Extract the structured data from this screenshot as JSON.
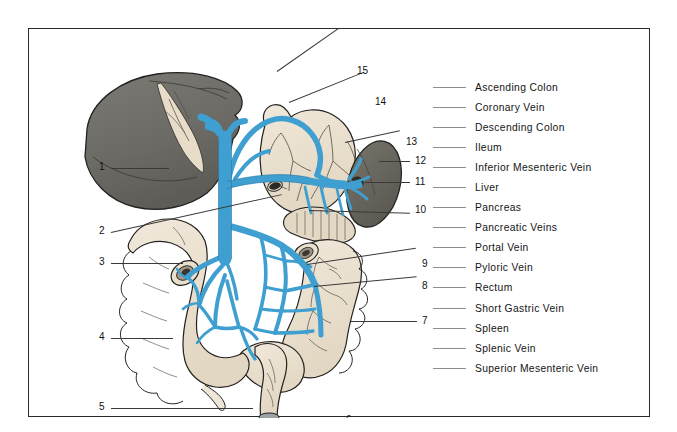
{
  "figure": {
    "organ_colors": {
      "liver": "#6d6c67",
      "spleen": "#67665f",
      "intestine": "#e9dfcd",
      "stomach": "#ece3d2",
      "pancreas": "#e3d8c4",
      "vein": "#3f9fd0",
      "vein_dark": "#2a7fae",
      "outline": "#23211e",
      "lead_line": "#3a3a3a"
    },
    "callouts": [
      {
        "num": "1",
        "x": 70,
        "y": 138,
        "line_x": 82,
        "line_y": 139,
        "line_w": 58,
        "angle": 0
      },
      {
        "num": "2",
        "x": 70,
        "y": 202,
        "line_x": 82,
        "line_y": 203,
        "line_w": 175,
        "angle": -12.5
      },
      {
        "num": "3",
        "x": 70,
        "y": 233,
        "line_x": 82,
        "line_y": 234,
        "line_w": 72,
        "angle": 0
      },
      {
        "num": "4",
        "x": 70,
        "y": 308,
        "line_x": 82,
        "line_y": 309,
        "line_w": 62,
        "angle": 0
      },
      {
        "num": "5",
        "x": 70,
        "y": 378,
        "line_x": 82,
        "line_y": 379,
        "line_w": 142,
        "angle": 0
      },
      {
        "num": "6",
        "x": 317,
        "y": 390,
        "line_x": 264,
        "line_y": 391,
        "line_w": 48,
        "angle": 0
      },
      {
        "num": "7",
        "x": 393,
        "y": 291,
        "line_x": 322,
        "line_y": 292,
        "line_w": 66,
        "angle": 0
      },
      {
        "num": "8",
        "x": 393,
        "y": 256,
        "line_x": 285,
        "line_y": 257,
        "line_w": 103,
        "angle": -5.5
      },
      {
        "num": "9",
        "x": 393,
        "y": 234,
        "line_x": 278,
        "line_y": 235,
        "line_w": 110,
        "angle": -8.5
      },
      {
        "num": "10",
        "x": 386,
        "y": 180,
        "line_x": 280,
        "line_y": 181,
        "line_w": 101,
        "angle": 1.5
      },
      {
        "num": "11",
        "x": 386,
        "y": 152,
        "line_x": 336,
        "line_y": 153,
        "line_w": 45,
        "angle": 0
      },
      {
        "num": "12",
        "x": 386,
        "y": 131,
        "line_x": 350,
        "line_y": 132,
        "line_w": 31,
        "angle": 0
      },
      {
        "num": "13",
        "x": 377,
        "y": 112,
        "line_x": 316,
        "line_y": 113,
        "line_w": 56,
        "angle": 12
      },
      {
        "num": "14",
        "x": 346,
        "y": 72,
        "line_x": 260,
        "line_y": 73,
        "line_w": 81,
        "angle": 22
      },
      {
        "num": "15",
        "x": 328,
        "y": 41,
        "line_x": 248,
        "line_y": 42,
        "line_w": 75,
        "angle": 35
      }
    ]
  },
  "legend": {
    "items": [
      {
        "label": "Ascending Colon"
      },
      {
        "label": "Coronary Vein"
      },
      {
        "label": "Descending Colon"
      },
      {
        "label": "Ileum"
      },
      {
        "label": "Inferior Mesenteric Vein"
      },
      {
        "label": "Liver"
      },
      {
        "label": "Pancreas"
      },
      {
        "label": "Pancreatic Veins"
      },
      {
        "label": "Portal Vein"
      },
      {
        "label": "Pyloric Vein"
      },
      {
        "label": "Rectum"
      },
      {
        "label": "Short  Gastric Vein"
      },
      {
        "label": "Spleen"
      },
      {
        "label": "Splenic Vein"
      },
      {
        "label": "Superior Mesenteric Vein"
      }
    ]
  }
}
